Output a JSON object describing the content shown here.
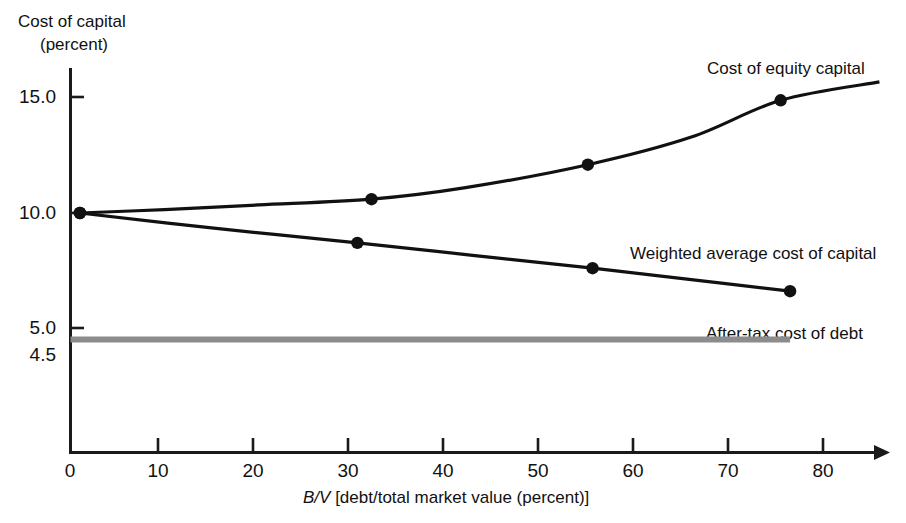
{
  "chart_data": {
    "type": "line",
    "title": "",
    "subtitle": "",
    "xlabel": "B/V [debt/total market value (percent)]",
    "xlabel_italic_prefix": "B/V",
    "xlabel_rest": " [debt/total market value (percent)]",
    "ylabel": "Cost of capital (percent)",
    "ylabel_line1": "Cost of capital",
    "ylabel_line2": "(percent)",
    "xlim": [
      0,
      86
    ],
    "ylim": [
      0,
      16.6
    ],
    "xticks": [
      0,
      10,
      20,
      30,
      40,
      50,
      60,
      70,
      80
    ],
    "xtick_labels": [
      "0",
      "10",
      "20",
      "30",
      "40",
      "50",
      "60",
      "70",
      "80"
    ],
    "yticks": [
      4.5,
      5.0,
      10.0,
      15.0
    ],
    "ytick_labels": [
      "4.5",
      "5.0",
      "10.0",
      "15.0"
    ],
    "grid": false,
    "legend_position": "inline-annotations",
    "series": [
      {
        "name": "Cost of equity capital",
        "label": "Cost of equity capital",
        "color": "#111111",
        "markers": true,
        "x": [
          1,
          32,
          55,
          75.5
        ],
        "y": [
          10.0,
          10.6,
          12.1,
          14.9
        ],
        "line_x": [
          1,
          10,
          20,
          32,
          42,
          55,
          66,
          75.5,
          86
        ],
        "line_y": [
          10.0,
          10.15,
          10.35,
          10.6,
          11.1,
          12.1,
          13.3,
          14.9,
          15.7
        ]
      },
      {
        "name": "Weighted average cost of capital",
        "label": "Weighted average cost of capital",
        "color": "#111111",
        "markers": true,
        "x": [
          1,
          30.5,
          55.5,
          76.5
        ],
        "y": [
          10.0,
          8.7,
          7.6,
          6.6
        ],
        "line_x": [
          1,
          15,
          30.5,
          43,
          55.5,
          66,
          76.5
        ],
        "line_y": [
          10.0,
          9.35,
          8.7,
          8.15,
          7.6,
          7.1,
          6.6
        ]
      },
      {
        "name": "After-tax cost of debt",
        "label": "After-tax cost of debt",
        "color": "#8c8c8c",
        "markers": false,
        "x": [
          0,
          76.5
        ],
        "y": [
          4.5,
          4.5
        ],
        "line_x": [
          0,
          76.5
        ],
        "line_y": [
          4.5,
          4.5
        ]
      }
    ],
    "annotations": [
      {
        "text": "Cost of equity capital",
        "x": 69,
        "y": 15.75
      },
      {
        "text": "Weighted average cost of capital",
        "x": 62,
        "y": 8.05
      },
      {
        "text": "After-tax cost of debt",
        "x": 64,
        "y": 5.45
      }
    ]
  }
}
